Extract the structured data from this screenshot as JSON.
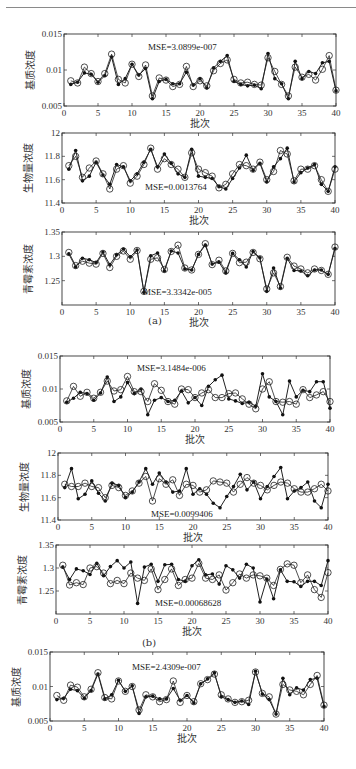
{
  "header": {
    "text": ""
  },
  "captions": [
    "(a)",
    "(b)"
  ],
  "chart_data": [
    {
      "type": "line",
      "group": "a",
      "title": "",
      "ylabel": "基质浓度",
      "xlabel": "批次",
      "xlim": [
        0,
        40
      ],
      "ylim": [
        0.005,
        0.015
      ],
      "xticks": [
        0,
        5,
        10,
        15,
        20,
        25,
        30,
        35,
        40
      ],
      "yticks": [
        0.005,
        0.01,
        0.015
      ],
      "ytick_labels": [
        "0.005",
        "0.01",
        "0.015"
      ],
      "annotation": "MSE=3.0899e-007",
      "frame": {
        "x": 64,
        "y": 34,
        "w": 272,
        "h": 72
      },
      "ann_pos": {
        "x": 148,
        "y": 50
      },
      "series": [
        {
          "name": "actual",
          "marker": "filled-dot",
          "values": [
            0.008,
            0.0083,
            0.0096,
            0.0094,
            0.0083,
            0.0092,
            0.0118,
            0.008,
            0.0088,
            0.0108,
            0.0093,
            0.0102,
            0.006,
            0.0084,
            0.0087,
            0.0081,
            0.0081,
            0.0097,
            0.0079,
            0.0088,
            0.0075,
            0.0103,
            0.0112,
            0.012,
            0.0084,
            0.008,
            0.0078,
            0.0079,
            0.0074,
            0.0123,
            0.0088,
            0.0081,
            0.006,
            0.0112,
            0.0088,
            0.0098,
            0.0095,
            0.011,
            0.0112,
            0.0071
          ]
        },
        {
          "name": "predicted",
          "marker": "open-circle",
          "values": [
            0.0085,
            0.0082,
            0.0104,
            0.0095,
            0.0084,
            0.0095,
            0.0122,
            0.0087,
            0.0082,
            0.0108,
            0.0091,
            0.0107,
            0.0064,
            0.0089,
            0.0086,
            0.0077,
            0.008,
            0.0105,
            0.0077,
            0.0085,
            0.0078,
            0.0099,
            0.0109,
            0.0114,
            0.0087,
            0.0082,
            0.0083,
            0.008,
            0.0079,
            0.0117,
            0.0098,
            0.008,
            0.0064,
            0.0104,
            0.009,
            0.0094,
            0.0086,
            0.0101,
            0.012,
            0.0072
          ]
        }
      ]
    },
    {
      "type": "line",
      "group": "a",
      "ylabel": "生物量浓度",
      "xlabel": "批次",
      "xlim": [
        0,
        40
      ],
      "ylim": [
        11.4,
        12
      ],
      "xticks": [
        0,
        5,
        10,
        15,
        20,
        25,
        30,
        35,
        40
      ],
      "yticks": [
        11.4,
        11.6,
        11.8,
        12
      ],
      "ytick_labels": [
        "11.4",
        "11.6",
        "11.8",
        "12"
      ],
      "annotation": "MSE=0.0013764",
      "frame": {
        "x": 62,
        "y": 133,
        "w": 273,
        "h": 70
      },
      "ann_pos": {
        "x": 145,
        "y": 190
      },
      "series": [
        {
          "name": "actual",
          "marker": "filled-dot",
          "values": [
            11.69,
            11.85,
            11.59,
            11.63,
            11.75,
            11.64,
            11.56,
            11.73,
            11.71,
            11.59,
            11.65,
            11.75,
            11.86,
            11.71,
            11.82,
            11.74,
            11.65,
            11.62,
            11.86,
            11.63,
            11.62,
            11.61,
            11.54,
            11.52,
            11.61,
            11.7,
            11.81,
            11.68,
            11.74,
            11.58,
            11.71,
            11.78,
            11.87,
            11.58,
            11.66,
            11.7,
            11.73,
            11.56,
            11.5,
            11.71
          ]
        },
        {
          "name": "predicted",
          "marker": "open-circle",
          "values": [
            11.72,
            11.8,
            11.62,
            11.7,
            11.76,
            11.65,
            11.52,
            11.69,
            11.72,
            11.57,
            11.63,
            11.73,
            11.87,
            11.69,
            11.78,
            11.73,
            11.69,
            11.62,
            11.83,
            11.69,
            11.66,
            11.63,
            11.53,
            11.56,
            11.65,
            11.73,
            11.72,
            11.69,
            11.75,
            11.6,
            11.67,
            11.85,
            11.82,
            11.59,
            11.69,
            11.69,
            11.72,
            11.6,
            11.5,
            11.69
          ]
        }
      ]
    },
    {
      "type": "line",
      "group": "a",
      "ylabel": "青霉素浓度",
      "xlabel": "批次",
      "xlim": [
        0,
        40
      ],
      "ylim": [
        1.2,
        1.35
      ],
      "xticks": [
        0,
        5,
        10,
        15,
        20,
        25,
        30,
        35,
        40
      ],
      "yticks": [
        1.25,
        1.3,
        1.35
      ],
      "ytick_labels": [
        "1.25",
        "1.3",
        "1.35"
      ],
      "annotation": "MSE=3.3342e-005",
      "frame": {
        "x": 62,
        "y": 232,
        "w": 273,
        "h": 73
      },
      "ann_pos": {
        "x": 143,
        "y": 295
      },
      "series": [
        {
          "name": "actual",
          "marker": "filled-dot",
          "values": [
            1.305,
            1.278,
            1.296,
            1.293,
            1.287,
            1.309,
            1.283,
            1.303,
            1.315,
            1.299,
            1.313,
            1.226,
            1.301,
            1.307,
            1.27,
            1.311,
            1.307,
            1.274,
            1.272,
            1.304,
            1.323,
            1.284,
            1.288,
            1.266,
            1.306,
            1.293,
            1.278,
            1.31,
            1.297,
            1.228,
            1.276,
            1.235,
            1.296,
            1.271,
            1.27,
            1.26,
            1.272,
            1.272,
            1.263,
            1.316
          ]
        },
        {
          "name": "predicted",
          "marker": "open-circle",
          "values": [
            1.308,
            1.281,
            1.29,
            1.286,
            1.284,
            1.306,
            1.277,
            1.3,
            1.311,
            1.294,
            1.312,
            1.228,
            1.294,
            1.297,
            1.273,
            1.31,
            1.323,
            1.276,
            1.272,
            1.304,
            1.326,
            1.283,
            1.292,
            1.27,
            1.306,
            1.287,
            1.288,
            1.308,
            1.295,
            1.233,
            1.266,
            1.238,
            1.298,
            1.28,
            1.274,
            1.266,
            1.274,
            1.271,
            1.263,
            1.319
          ]
        }
      ]
    },
    {
      "type": "line",
      "group": "b",
      "ylabel": "基质浓度",
      "xlabel": "批次",
      "xlim": [
        0,
        40
      ],
      "ylim": [
        0.005,
        0.015
      ],
      "xticks": [
        0,
        5,
        10,
        15,
        20,
        25,
        30,
        35,
        40
      ],
      "yticks": [
        0.005,
        0.01,
        0.015
      ],
      "ytick_labels": [
        "0.005",
        "0.01",
        "0.015"
      ],
      "annotation": "MSE=3.1484e-006",
      "frame": {
        "x": 60,
        "y": 356,
        "w": 270,
        "h": 66
      },
      "ann_pos": {
        "x": 137,
        "y": 371
      },
      "series": [
        {
          "name": "actual",
          "marker": "filled-dot",
          "values": [
            0.008,
            0.0086,
            0.0095,
            0.0093,
            0.0083,
            0.0094,
            0.0118,
            0.0081,
            0.0088,
            0.011,
            0.0093,
            0.01,
            0.0061,
            0.0083,
            0.0087,
            0.0081,
            0.0083,
            0.0097,
            0.0079,
            0.0087,
            0.0075,
            0.0104,
            0.0114,
            0.0121,
            0.0085,
            0.0082,
            0.0078,
            0.008,
            0.0074,
            0.0123,
            0.0088,
            0.0081,
            0.0061,
            0.0112,
            0.0088,
            0.0098,
            0.0096,
            0.0111,
            0.0111,
            0.0071
          ]
        },
        {
          "name": "predicted",
          "marker": "open-circle",
          "values": [
            0.0082,
            0.0104,
            0.0089,
            0.0095,
            0.0086,
            0.0095,
            0.0112,
            0.0097,
            0.0099,
            0.0119,
            0.0096,
            0.0096,
            0.0081,
            0.0108,
            0.0098,
            0.0081,
            0.0077,
            0.01,
            0.0099,
            0.0087,
            0.0094,
            0.0099,
            0.0087,
            0.0087,
            0.0093,
            0.0094,
            0.0085,
            0.0077,
            0.007,
            0.01,
            0.0111,
            0.0081,
            0.008,
            0.0081,
            0.0077,
            0.0099,
            0.0087,
            0.0091,
            0.0096,
            0.0081
          ]
        }
      ]
    },
    {
      "type": "line",
      "group": "b",
      "ylabel": "生物量浓度",
      "xlabel": "批次",
      "xlim": [
        0,
        40
      ],
      "ylim": [
        11.4,
        12
      ],
      "xticks": [
        0,
        5,
        10,
        15,
        20,
        25,
        30,
        35,
        40
      ],
      "yticks": [
        11.4,
        11.6,
        11.8,
        12
      ],
      "ytick_labels": [
        "11.4",
        "11.6",
        "11.8",
        "12"
      ],
      "annotation": "MSE=0.0099406",
      "frame": {
        "x": 58,
        "y": 453,
        "w": 270,
        "h": 67
      },
      "ann_pos": {
        "x": 151,
        "y": 517
      },
      "series": [
        {
          "name": "actual",
          "marker": "filled-dot",
          "values": [
            11.69,
            11.86,
            11.59,
            11.63,
            11.75,
            11.64,
            11.57,
            11.73,
            11.71,
            11.6,
            11.65,
            11.74,
            11.86,
            11.72,
            11.82,
            11.74,
            11.65,
            11.66,
            11.86,
            11.63,
            11.68,
            11.63,
            11.55,
            11.51,
            11.61,
            11.7,
            11.81,
            11.67,
            11.74,
            11.59,
            11.7,
            11.79,
            11.87,
            11.59,
            11.66,
            11.69,
            11.74,
            11.57,
            11.51,
            11.72
          ]
        },
        {
          "name": "predicted",
          "marker": "open-circle",
          "values": [
            11.72,
            11.7,
            11.7,
            11.73,
            11.7,
            11.69,
            11.6,
            11.71,
            11.69,
            11.62,
            11.66,
            11.73,
            11.79,
            11.57,
            11.77,
            11.72,
            11.76,
            11.62,
            11.72,
            11.71,
            11.65,
            11.67,
            11.75,
            11.74,
            11.73,
            11.65,
            11.72,
            11.78,
            11.73,
            11.71,
            11.67,
            11.71,
            11.74,
            11.73,
            11.68,
            11.65,
            11.65,
            11.68,
            11.72,
            11.66
          ]
        }
      ]
    },
    {
      "type": "line",
      "group": "b",
      "ylabel": "青霉素浓度",
      "xlabel": "批次",
      "xlim": [
        0,
        40
      ],
      "ylim": [
        1.2,
        1.35
      ],
      "xticks": [
        0,
        5,
        10,
        15,
        20,
        25,
        30,
        35,
        40
      ],
      "yticks": [
        1.25,
        1.3,
        1.35
      ],
      "ytick_labels": [
        "1.25",
        "1.3",
        "1.35"
      ],
      "annotation": "MSE=0.00068628",
      "frame": {
        "x": 56,
        "y": 545,
        "w": 272,
        "h": 69
      },
      "ann_pos": {
        "x": 155,
        "y": 606
      },
      "series": [
        {
          "name": "actual",
          "marker": "filled-dot",
          "values": [
            1.302,
            1.275,
            1.298,
            1.294,
            1.286,
            1.31,
            1.283,
            1.303,
            1.316,
            1.3,
            1.313,
            1.223,
            1.302,
            1.308,
            1.271,
            1.307,
            1.308,
            1.275,
            1.271,
            1.305,
            1.318,
            1.285,
            1.287,
            1.265,
            1.305,
            1.296,
            1.278,
            1.308,
            1.3,
            1.226,
            1.276,
            1.233,
            1.296,
            1.271,
            1.27,
            1.26,
            1.271,
            1.271,
            1.262,
            1.316
          ]
        },
        {
          "name": "predicted",
          "marker": "open-circle",
          "values": [
            1.306,
            1.263,
            1.268,
            1.264,
            1.3,
            1.303,
            1.289,
            1.266,
            1.273,
            1.266,
            1.289,
            1.278,
            1.273,
            1.298,
            1.253,
            1.275,
            1.298,
            1.262,
            1.275,
            1.278,
            1.31,
            1.278,
            1.275,
            1.285,
            1.252,
            1.268,
            1.287,
            1.278,
            1.285,
            1.283,
            1.278,
            1.262,
            1.297,
            1.309,
            1.306,
            1.268,
            1.285,
            1.253,
            1.236,
            1.29
          ]
        }
      ]
    },
    {
      "type": "line",
      "group": "c",
      "ylabel": "基质浓度",
      "xlabel": "批次",
      "xlim": [
        0,
        40
      ],
      "ylim": [
        0.005,
        0.015
      ],
      "xticks": [
        0,
        5,
        10,
        15,
        20,
        25,
        30,
        35,
        40
      ],
      "yticks": [
        0.005,
        0.01,
        0.015
      ],
      "ytick_labels": [
        "0.005",
        "0.01",
        "0.015"
      ],
      "annotation": "MSE=2.4309e-007",
      "frame": {
        "x": 50,
        "y": 652,
        "w": 274,
        "h": 69
      },
      "ann_pos": {
        "x": 132,
        "y": 670
      },
      "series": [
        {
          "name": "actual",
          "marker": "filled-dot",
          "values": [
            0.0081,
            0.0083,
            0.0096,
            0.0094,
            0.0083,
            0.0094,
            0.0118,
            0.0082,
            0.0088,
            0.0109,
            0.0093,
            0.0101,
            0.0061,
            0.0085,
            0.0086,
            0.0082,
            0.0082,
            0.0097,
            0.008,
            0.0087,
            0.0076,
            0.0104,
            0.0111,
            0.012,
            0.0085,
            0.0081,
            0.0077,
            0.0079,
            0.0074,
            0.0122,
            0.0089,
            0.0081,
            0.006,
            0.0112,
            0.0088,
            0.0098,
            0.0095,
            0.011,
            0.0112,
            0.0071
          ]
        },
        {
          "name": "predicted",
          "marker": "open-circle",
          "values": [
            0.0087,
            0.008,
            0.0102,
            0.0099,
            0.0085,
            0.0096,
            0.012,
            0.0084,
            0.0082,
            0.0108,
            0.0093,
            0.01,
            0.0066,
            0.0088,
            0.0085,
            0.0078,
            0.0081,
            0.0108,
            0.0077,
            0.0087,
            0.0078,
            0.0104,
            0.011,
            0.0118,
            0.0088,
            0.0082,
            0.0077,
            0.0078,
            0.008,
            0.0121,
            0.009,
            0.0085,
            0.006,
            0.0103,
            0.0095,
            0.0093,
            0.0088,
            0.0103,
            0.0116,
            0.0073
          ]
        }
      ]
    }
  ]
}
